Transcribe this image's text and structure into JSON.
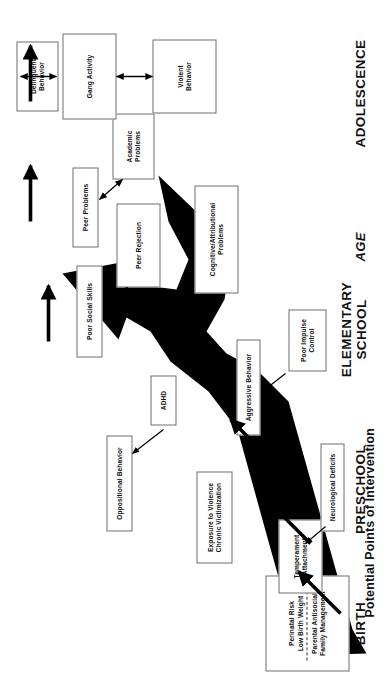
{
  "figure": {
    "title": "Potential Points of Intervention",
    "axis_label": "AGE",
    "orientation": "rotated-90-ccw",
    "background_color": "#ffffff",
    "pathway_color": "#000000",
    "box_border_color": "#6e6e6e"
  },
  "stages": [
    {
      "id": "birth",
      "label": "BIRTH"
    },
    {
      "id": "preschool",
      "label": "PRESCHOOL"
    },
    {
      "id": "elementary",
      "label": "ELEMENTARY\nSCHOOL"
    },
    {
      "id": "adolescence",
      "label": "ADOLESCENCE"
    }
  ],
  "nodes": [
    {
      "id": "perinatal",
      "lines": [
        "Perinatal Risk",
        "Low Birth Weight"
      ],
      "lines2": [
        "Parental Antisocial",
        "Family Management"
      ],
      "divider": true
    },
    {
      "id": "temperament",
      "lines": [
        "Temperament",
        "Attachment"
      ]
    },
    {
      "id": "neurological",
      "lines": [
        "Neurological Deficits"
      ]
    },
    {
      "id": "exposure",
      "lines": [
        "Exposure to Violence",
        "Chronic Victimization"
      ]
    },
    {
      "id": "oppositional",
      "lines": [
        "Oppositional Behavior"
      ]
    },
    {
      "id": "adhd",
      "lines": [
        "ADHD"
      ]
    },
    {
      "id": "poor-impulse",
      "lines": [
        "Poor Impulse",
        "Control"
      ]
    },
    {
      "id": "aggressive",
      "lines": [
        "Aggressive Behavior"
      ]
    },
    {
      "id": "poor-social",
      "lines": [
        "Poor Social Skills"
      ]
    },
    {
      "id": "peer-rejection",
      "lines": [
        "Peer Rejection"
      ]
    },
    {
      "id": "cognitive",
      "lines": [
        "Cognitive/Attributional",
        "Problems"
      ]
    },
    {
      "id": "peer-problems",
      "lines": [
        "Peer Problems"
      ]
    },
    {
      "id": "academic",
      "lines": [
        "Academic",
        "Problems"
      ]
    },
    {
      "id": "delinquent",
      "lines": [
        "Delinquent",
        "Behavior"
      ]
    },
    {
      "id": "gang",
      "lines": [
        "Gang Activity"
      ]
    },
    {
      "id": "violent",
      "lines": [
        "Violent",
        "Behavior"
      ]
    }
  ],
  "intervention_arrows": {
    "count": 6,
    "description": "Thick black arrows marking potential points of intervention along the developmental pathway"
  }
}
